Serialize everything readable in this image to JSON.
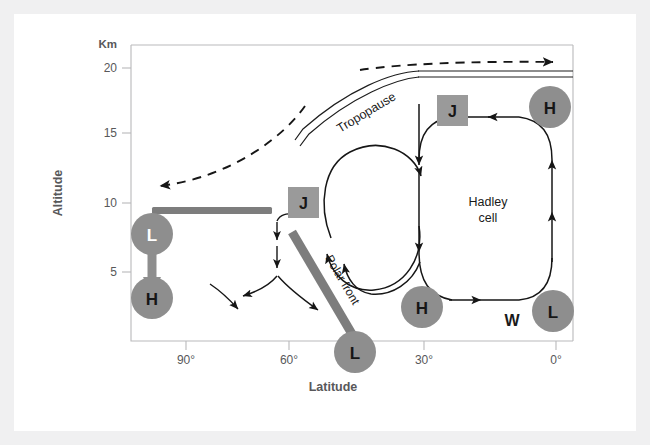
{
  "figure": {
    "type": "atmospheric-circulation-diagram",
    "axes": {
      "y_unit_label": "Km",
      "y_axis_title": "Altitude",
      "y_ticks": [
        "20",
        "15",
        "10",
        "5"
      ],
      "x_axis_title": "Latitude",
      "x_ticks": [
        "90°",
        "60°",
        "30°",
        "0°"
      ]
    },
    "labels": {
      "tropopause": "Tropopause",
      "polar_front": "Polar front",
      "hadley_cell_line1": "Hadley",
      "hadley_cell_line2": "cell",
      "westerlies": "W"
    },
    "pressure_markers": [
      {
        "id": "polar-low",
        "text": "L",
        "lat": "90°",
        "altitude_km": 8.6
      },
      {
        "id": "polar-high-surface",
        "text": "H",
        "lat": "90°",
        "altitude_km": 2.5
      },
      {
        "id": "polar-front-low",
        "text": "L",
        "lat": "55°",
        "altitude_km": 0
      },
      {
        "id": "subtropical-high",
        "text": "H",
        "lat": "30°",
        "altitude_km": 2.5
      },
      {
        "id": "equatorial-low",
        "text": "L",
        "lat": "0°",
        "altitude_km": 2.5
      },
      {
        "id": "upper-equatorial-high",
        "text": "H",
        "lat": "2°",
        "altitude_km": 17
      }
    ],
    "jet_streams": [
      {
        "id": "polar-jet",
        "text": "J",
        "lat": "62°",
        "altitude_km": 9.6
      },
      {
        "id": "subtropical-jet",
        "text": "J",
        "lat": "30°",
        "altitude_km": 16.8
      }
    ],
    "colors": {
      "marker_gray": "#8e8e8e",
      "jet_box_gray": "#9a9a9a",
      "bar_gray": "#7d7d7d",
      "axis_gray": "#b9b9bb",
      "ink": "#161616",
      "frame": "#f0f0f1"
    }
  }
}
